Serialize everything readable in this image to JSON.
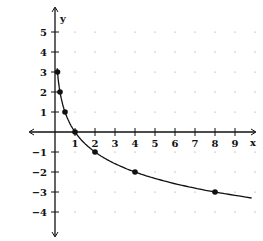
{
  "chart_data": {
    "type": "line",
    "title": "",
    "xlabel": "x",
    "ylabel": "y",
    "xlim": [
      -1,
      10
    ],
    "ylim": [
      -5,
      6
    ],
    "x_ticks": [
      1,
      2,
      3,
      4,
      5,
      6,
      7,
      8,
      9
    ],
    "y_ticks": [
      5,
      4,
      3,
      2,
      1,
      -1,
      -2,
      -3,
      -4
    ],
    "grid": "dots",
    "function": "y = -log2(x)",
    "points": [
      {
        "x": 0.125,
        "y": 3
      },
      {
        "x": 0.25,
        "y": 2
      },
      {
        "x": 0.5,
        "y": 1
      },
      {
        "x": 1,
        "y": 0
      },
      {
        "x": 2,
        "y": -1
      },
      {
        "x": 4,
        "y": -2
      },
      {
        "x": 8,
        "y": -3
      }
    ]
  }
}
